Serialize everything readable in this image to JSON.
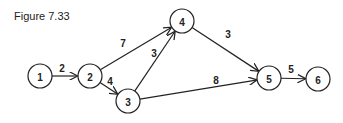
{
  "title": "Figure 7.33",
  "nodes": [
    {
      "id": "1",
      "x": 40,
      "y": 76
    },
    {
      "id": "2",
      "x": 90,
      "y": 76
    },
    {
      "id": "3",
      "x": 128,
      "y": 101
    },
    {
      "id": "4",
      "x": 182,
      "y": 21
    },
    {
      "id": "5",
      "x": 269,
      "y": 78
    },
    {
      "id": "6",
      "x": 318,
      "y": 79
    }
  ],
  "edges": [
    {
      "from": "1",
      "to": "2",
      "weight": "2",
      "lx": 62,
      "ly": 72
    },
    {
      "from": "2",
      "to": "4",
      "weight": "7",
      "lx": 123,
      "ly": 47
    },
    {
      "from": "2",
      "to": "3",
      "weight": "4",
      "lx": 110,
      "ly": 85
    },
    {
      "from": "3",
      "to": "4",
      "weight": "3",
      "lx": 154,
      "ly": 57
    },
    {
      "from": "4",
      "to": "5",
      "weight": "3",
      "lx": 228,
      "ly": 38
    },
    {
      "from": "3",
      "to": "5",
      "weight": "8",
      "lx": 216,
      "ly": 84
    },
    {
      "from": "5",
      "to": "6",
      "weight": "5",
      "lx": 291,
      "ly": 73
    }
  ]
}
